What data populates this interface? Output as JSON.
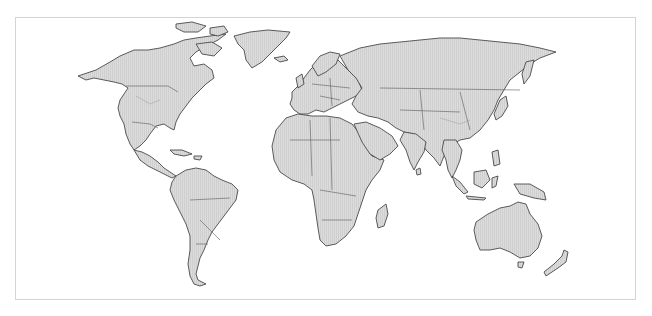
{
  "map": {
    "type": "world-political-outline",
    "projection": "equirectangular-like",
    "labels": [],
    "colors": {
      "background": "#ffffff",
      "frame": "#d4d4d4",
      "land_fill": "#dcdcdc",
      "land_hatch": "#c6c6c6",
      "coastline": "#4a4a4a",
      "country_border": "#5a5a5a",
      "internal_border": "#9a9a9a"
    },
    "regions": [
      {
        "name": "North America"
      },
      {
        "name": "Greenland"
      },
      {
        "name": "Central America & Caribbean"
      },
      {
        "name": "South America"
      },
      {
        "name": "Europe"
      },
      {
        "name": "Africa"
      },
      {
        "name": "Madagascar"
      },
      {
        "name": "Middle East"
      },
      {
        "name": "Russia & Central Asia"
      },
      {
        "name": "South Asia"
      },
      {
        "name": "East Asia"
      },
      {
        "name": "Japan"
      },
      {
        "name": "Southeast Asia"
      },
      {
        "name": "New Guinea"
      },
      {
        "name": "Australia"
      },
      {
        "name": "New Zealand"
      }
    ]
  }
}
